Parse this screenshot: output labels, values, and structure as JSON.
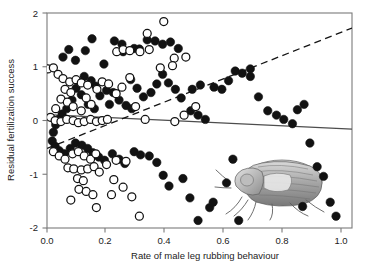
{
  "chart_data": {
    "type": "scatter",
    "title": "",
    "xlabel": "Rate of male leg rubbing behaviour",
    "ylabel": "Residual fertilization success",
    "xlim": [
      0.0,
      1.05
    ],
    "ylim": [
      -2.0,
      2.0
    ],
    "grid": false,
    "legend": "none",
    "xticks": [
      "0.0",
      "0.2",
      "0.4",
      "0.6",
      "0.8",
      "1.0"
    ],
    "xtick_values": [
      0.0,
      0.2,
      0.4,
      0.6,
      0.8,
      1.0
    ],
    "yticks": [
      "2",
      "1",
      "0",
      "-1",
      "-2"
    ],
    "ytick_values": [
      2,
      1,
      0,
      -1,
      -2
    ],
    "series": [
      {
        "name": "filled",
        "marker": "filled-circle",
        "color": "#121212",
        "points": [
          [
            0.055,
            1.18
          ],
          [
            0.075,
            1.32
          ],
          [
            0.098,
            1.12
          ],
          [
            0.132,
            1.3
          ],
          [
            0.155,
            1.52
          ],
          [
            0.128,
            0.82
          ],
          [
            0.152,
            0.74
          ],
          [
            0.168,
            0.64
          ],
          [
            0.196,
            1.05
          ],
          [
            0.232,
            1.48
          ],
          [
            0.258,
            1.42
          ],
          [
            0.262,
            1.28
          ],
          [
            0.3,
            1.34
          ],
          [
            0.318,
            1.33
          ],
          [
            0.345,
            1.5
          ],
          [
            0.372,
            1.48
          ],
          [
            0.398,
            1.42
          ],
          [
            0.425,
            1.46
          ],
          [
            0.452,
            1.34
          ],
          [
            0.205,
            0.56
          ],
          [
            0.228,
            0.52
          ],
          [
            0.248,
            0.38
          ],
          [
            0.272,
            0.28
          ],
          [
            0.292,
            0.22
          ],
          [
            0.215,
            0.3
          ],
          [
            0.182,
            0.46
          ],
          [
            0.163,
            0.22
          ],
          [
            0.142,
            0.3
          ],
          [
            0.118,
            0.48
          ],
          [
            0.1,
            0.6
          ],
          [
            0.086,
            0.38
          ],
          [
            0.068,
            0.22
          ],
          [
            0.052,
            0.12
          ],
          [
            0.04,
            0.02
          ],
          [
            0.03,
            -0.08
          ],
          [
            0.022,
            -0.22
          ],
          [
            0.018,
            -0.38
          ],
          [
            0.028,
            -0.48
          ],
          [
            0.042,
            -0.56
          ],
          [
            0.06,
            -0.62
          ],
          [
            0.08,
            -0.52
          ],
          [
            0.098,
            -0.42
          ],
          [
            0.12,
            -0.46
          ],
          [
            0.14,
            -0.52
          ],
          [
            0.158,
            -0.6
          ],
          [
            0.178,
            -0.68
          ],
          [
            0.198,
            -0.74
          ],
          [
            0.225,
            -0.62
          ],
          [
            0.248,
            -0.72
          ],
          [
            0.268,
            -0.8
          ],
          [
            0.3,
            -0.58
          ],
          [
            0.322,
            -0.64
          ],
          [
            0.352,
            -0.66
          ],
          [
            0.378,
            -0.78
          ],
          [
            0.4,
            -1.02
          ],
          [
            0.42,
            -1.22
          ],
          [
            0.468,
            -1.08
          ],
          [
            0.492,
            -1.44
          ],
          [
            0.52,
            -1.86
          ],
          [
            0.56,
            -1.62
          ],
          [
            0.495,
            0.18
          ],
          [
            0.52,
            0.1
          ],
          [
            0.545,
            0.02
          ],
          [
            0.5,
            0.58
          ],
          [
            0.528,
            0.66
          ],
          [
            0.462,
            0.42
          ],
          [
            0.442,
            0.58
          ],
          [
            0.418,
            0.7
          ],
          [
            0.398,
            0.86
          ],
          [
            0.378,
            0.68
          ],
          [
            0.358,
            0.52
          ],
          [
            0.332,
            0.44
          ],
          [
            0.31,
            0.6
          ],
          [
            0.288,
            0.76
          ],
          [
            0.575,
            0.62
          ],
          [
            0.602,
            0.58
          ],
          [
            0.625,
            0.74
          ],
          [
            0.648,
            0.92
          ],
          [
            0.672,
            0.88
          ],
          [
            0.7,
            0.96
          ],
          [
            0.7,
            0.82
          ],
          [
            0.728,
            0.44
          ],
          [
            0.76,
            0.18
          ],
          [
            0.79,
            0.1
          ],
          [
            0.815,
            0.02
          ],
          [
            0.845,
            -0.06
          ],
          [
            0.862,
            0.2
          ],
          [
            0.885,
            0.3
          ],
          [
            0.905,
            -0.42
          ],
          [
            0.93,
            -0.86
          ],
          [
            0.952,
            -1.04
          ],
          [
            0.975,
            -1.52
          ],
          [
            0.995,
            -1.78
          ],
          [
            0.88,
            -1.6
          ],
          [
            0.64,
            -0.72
          ],
          [
            0.618,
            -1.16
          ],
          [
            0.572,
            -1.52
          ],
          [
            0.66,
            -1.86
          ]
        ]
      },
      {
        "name": "open",
        "marker": "open-circle",
        "color": "#ffffff",
        "points": [
          [
            0.003,
            0.96
          ],
          [
            0.022,
            0.98
          ],
          [
            0.038,
            0.86
          ],
          [
            0.055,
            0.78
          ],
          [
            0.078,
            0.72
          ],
          [
            0.1,
            0.76
          ],
          [
            0.118,
            0.7
          ],
          [
            0.14,
            0.66
          ],
          [
            0.062,
            0.58
          ],
          [
            0.082,
            0.52
          ],
          [
            0.048,
            0.4
          ],
          [
            0.07,
            0.34
          ],
          [
            0.09,
            0.26
          ],
          [
            0.03,
            0.22
          ],
          [
            0.012,
            0.06
          ],
          [
            0.028,
            0.0
          ],
          [
            0.048,
            -0.02
          ],
          [
            0.068,
            0.02
          ],
          [
            0.09,
            0.0
          ],
          [
            0.108,
            -0.04
          ],
          [
            0.128,
            -0.02
          ],
          [
            0.15,
            0.02
          ],
          [
            0.17,
            -0.02
          ],
          [
            0.19,
            0.0
          ],
          [
            0.208,
            0.02
          ],
          [
            0.118,
            0.18
          ],
          [
            0.152,
            0.3
          ],
          [
            0.135,
            0.42
          ],
          [
            0.172,
            0.58
          ],
          [
            0.19,
            0.72
          ],
          [
            0.212,
            0.68
          ],
          [
            0.24,
            1.28
          ],
          [
            0.262,
            1.32
          ],
          [
            0.285,
            1.3
          ],
          [
            0.32,
            1.28
          ],
          [
            0.345,
            1.62
          ],
          [
            0.352,
            1.32
          ],
          [
            0.402,
            1.84
          ],
          [
            0.438,
            1.16
          ],
          [
            0.478,
            1.18
          ],
          [
            0.285,
            0.8
          ],
          [
            0.258,
            0.62
          ],
          [
            0.238,
            0.5
          ],
          [
            0.305,
            0.26
          ],
          [
            0.338,
            0.02
          ],
          [
            0.44,
            -0.02
          ],
          [
            0.472,
            0.1
          ],
          [
            0.512,
            0.26
          ],
          [
            0.022,
            -0.58
          ],
          [
            0.042,
            -0.66
          ],
          [
            0.062,
            -0.72
          ],
          [
            0.088,
            -0.62
          ],
          [
            0.108,
            -0.58
          ],
          [
            0.128,
            -0.66
          ],
          [
            0.15,
            -0.72
          ],
          [
            0.168,
            -0.62
          ],
          [
            0.072,
            -0.88
          ],
          [
            0.092,
            -0.9
          ],
          [
            0.118,
            -0.92
          ],
          [
            0.14,
            -0.9
          ],
          [
            0.162,
            -0.86
          ],
          [
            0.105,
            -1.08
          ],
          [
            0.125,
            -1.12
          ],
          [
            0.11,
            -1.28
          ],
          [
            0.135,
            -1.32
          ],
          [
            0.082,
            -1.48
          ],
          [
            0.158,
            -1.38
          ],
          [
            0.17,
            -1.62
          ],
          [
            0.222,
            -1.38
          ],
          [
            0.23,
            -1.1
          ],
          [
            0.262,
            -1.24
          ],
          [
            0.292,
            -1.42
          ],
          [
            0.318,
            -1.78
          ],
          [
            0.238,
            -0.74
          ],
          [
            0.272,
            -0.76
          ],
          [
            0.205,
            -0.82
          ],
          [
            0.18,
            -0.96
          ],
          [
            0.39,
            0.98
          ],
          [
            0.432,
            1.02
          ]
        ]
      }
    ],
    "trendlines": [
      {
        "name": "solid-regression",
        "style": "solid",
        "color": "#4d4d4d",
        "x_start": 0.0,
        "y_start": 0.11,
        "x_end": 1.05,
        "y_end": -0.16
      },
      {
        "name": "dashed-regression",
        "style": "dashed",
        "color": "#141414",
        "x_start": 0.0,
        "y_start": -0.52,
        "x_end": 1.05,
        "y_end": 1.72
      }
    ],
    "annotations": [
      {
        "name": "beetle-illustration",
        "type": "image",
        "description": "grayscale beetle drawing",
        "x": 0.62,
        "y": -1.05
      }
    ]
  }
}
